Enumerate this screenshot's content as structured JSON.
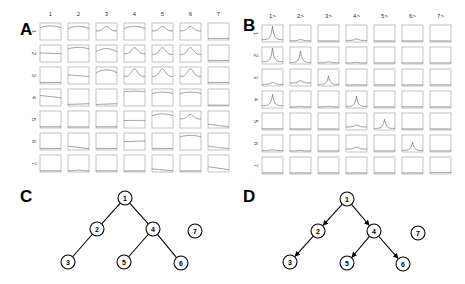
{
  "panels": {
    "A": {
      "letter": "A"
    },
    "B": {
      "letter": "B"
    },
    "C": {
      "letter": "C"
    },
    "D": {
      "letter": "D"
    }
  },
  "chart_data": [
    {
      "type": "line",
      "panel": "A",
      "title": "",
      "description": "7x7 grid of small line plots (row i vs column j)",
      "col_labels": [
        "1",
        "2",
        "3",
        "4",
        "5",
        "6",
        "7"
      ],
      "row_labels": [
        "1",
        "2",
        "3",
        "4",
        "5",
        "6",
        "7"
      ],
      "grid": [
        [
          {
            "shape": "arch",
            "level": 0.8,
            "amp": 0.12
          },
          {
            "shape": "arch",
            "level": 0.75,
            "amp": 0.15
          },
          {
            "shape": "peak",
            "level": 0.55,
            "amp": 0.3
          },
          {
            "shape": "arch",
            "level": 0.75,
            "amp": 0.15
          },
          {
            "shape": "peak",
            "level": 0.55,
            "amp": 0.3
          },
          {
            "shape": "peak",
            "level": 0.55,
            "amp": 0.3
          },
          {
            "shape": "flat",
            "level": 0.05
          }
        ],
        [
          {
            "shape": "slope",
            "level": 0.55,
            "end": 0.5
          },
          {
            "shape": "arch",
            "level": 0.85,
            "amp": 0.1
          },
          {
            "shape": "arch",
            "level": 0.7,
            "amp": 0.2
          },
          {
            "shape": "peak",
            "level": 0.5,
            "amp": 0.4
          },
          {
            "shape": "peak",
            "level": 0.45,
            "amp": 0.45
          },
          {
            "shape": "peak",
            "level": 0.45,
            "amp": 0.45
          },
          {
            "shape": "flat",
            "level": 0.05
          }
        ],
        [
          {
            "shape": "flat",
            "level": 0.05
          },
          {
            "shape": "slope",
            "level": 0.55,
            "end": 0.45
          },
          {
            "shape": "arch",
            "level": 0.75,
            "amp": 0.2
          },
          {
            "shape": "peak",
            "level": 0.45,
            "amp": 0.5
          },
          {
            "shape": "peak",
            "level": 0.45,
            "amp": 0.5
          },
          {
            "shape": "peak",
            "level": 0.45,
            "amp": 0.5
          },
          {
            "shape": "flat",
            "level": 0.05
          }
        ],
        [
          {
            "shape": "slope",
            "level": 0.65,
            "end": 0.5
          },
          {
            "shape": "slope",
            "level": 0.05,
            "end": 0.1
          },
          {
            "shape": "slope",
            "level": 0.05,
            "end": 0.1
          },
          {
            "shape": "arch",
            "level": 0.9,
            "amp": 0.05
          },
          {
            "shape": "arch",
            "level": 0.8,
            "amp": 0.1
          },
          {
            "shape": "arch",
            "level": 0.8,
            "amp": 0.1
          },
          {
            "shape": "flat",
            "level": 0.0
          }
        ],
        [
          {
            "shape": "flat",
            "level": 0.03
          },
          {
            "shape": "flat",
            "level": 0.02
          },
          {
            "shape": "flat",
            "level": 0.03
          },
          {
            "shape": "slope",
            "level": 0.45,
            "end": 0.45
          },
          {
            "shape": "arch",
            "level": 0.8,
            "amp": 0.12
          },
          {
            "shape": "peak",
            "level": 0.55,
            "amp": 0.3
          },
          {
            "shape": "slope",
            "level": 0.2,
            "end": 0.03
          }
        ],
        [
          {
            "shape": "flat",
            "level": 0.05
          },
          {
            "shape": "slope",
            "level": 0.2,
            "end": 0.03
          },
          {
            "shape": "flat",
            "level": 0.05
          },
          {
            "shape": "slope",
            "level": 0.5,
            "end": 0.55
          },
          {
            "shape": "flat",
            "level": 0.05
          },
          {
            "shape": "arch",
            "level": 0.85,
            "amp": 0.1
          },
          {
            "shape": "slope",
            "level": 0.2,
            "end": 0.03
          }
        ],
        [
          {
            "shape": "flat",
            "level": 0.03
          },
          {
            "shape": "bump",
            "level": 0.03,
            "amp": 0.05
          },
          {
            "shape": "flat",
            "level": 0.03
          },
          {
            "shape": "flat",
            "level": 0.02
          },
          {
            "shape": "slope",
            "level": 0.15,
            "end": 0.02
          },
          {
            "shape": "flat",
            "level": 0.02
          },
          {
            "shape": "slope",
            "level": 0.3,
            "end": 0.1
          }
        ]
      ]
    },
    {
      "type": "line",
      "panel": "B",
      "title": "",
      "description": "7x7 grid of small line plots; sharp peaks mostly on diagonal",
      "col_labels": [
        "1>",
        "2>",
        "3>",
        "4>",
        "5>",
        "6>",
        "7>"
      ],
      "row_labels": [
        "1",
        "2",
        "3",
        "4",
        "5",
        "6",
        "7"
      ],
      "grid": [
        [
          {
            "shape": "spike",
            "level": 0.1,
            "amp": 0.9
          },
          {
            "shape": "bump",
            "level": 0.03,
            "amp": 0.08
          },
          {
            "shape": "flat",
            "level": 0.02
          },
          {
            "shape": "bump",
            "level": 0.05,
            "amp": 0.1
          },
          {
            "shape": "flat",
            "level": 0.02
          },
          {
            "shape": "flat",
            "level": 0.02
          },
          {
            "shape": "flat",
            "level": 0.02
          }
        ],
        [
          {
            "shape": "spike",
            "level": 0.1,
            "amp": 0.9
          },
          {
            "shape": "spike",
            "level": 0.05,
            "amp": 0.75
          },
          {
            "shape": "bump",
            "level": 0.03,
            "amp": 0.06
          },
          {
            "shape": "bump",
            "level": 0.02,
            "amp": 0.04
          },
          {
            "shape": "flat",
            "level": 0.02
          },
          {
            "shape": "flat",
            "level": 0.02
          },
          {
            "shape": "flat",
            "level": 0.02
          }
        ],
        [
          {
            "shape": "bump",
            "level": 0.05,
            "amp": 0.12
          },
          {
            "shape": "bump",
            "level": 0.15,
            "amp": 0.15
          },
          {
            "shape": "spike",
            "level": 0.05,
            "amp": 0.55
          },
          {
            "shape": "flat",
            "level": 0.02
          },
          {
            "shape": "flat",
            "level": 0.02
          },
          {
            "shape": "flat",
            "level": 0.02
          },
          {
            "shape": "flat",
            "level": 0.02
          }
        ],
        [
          {
            "shape": "spike",
            "level": 0.1,
            "amp": 0.75
          },
          {
            "shape": "bump",
            "level": 0.02,
            "amp": 0.04
          },
          {
            "shape": "bump",
            "level": 0.02,
            "amp": 0.04
          },
          {
            "shape": "spike",
            "level": 0.05,
            "amp": 0.7
          },
          {
            "shape": "flat",
            "level": 0.02
          },
          {
            "shape": "flat",
            "level": 0.03
          },
          {
            "shape": "flat",
            "level": 0.02
          }
        ],
        [
          {
            "shape": "flat",
            "level": 0.03
          },
          {
            "shape": "flat",
            "level": 0.02
          },
          {
            "shape": "flat",
            "level": 0.02
          },
          {
            "shape": "bump",
            "level": 0.15,
            "amp": 0.12
          },
          {
            "shape": "spike",
            "level": 0.05,
            "amp": 0.6
          },
          {
            "shape": "flat",
            "level": 0.02
          },
          {
            "shape": "flat",
            "level": 0.02
          }
        ],
        [
          {
            "shape": "bump",
            "level": 0.04,
            "amp": 0.05
          },
          {
            "shape": "bump",
            "level": 0.02,
            "amp": 0.03
          },
          {
            "shape": "flat",
            "level": 0.02
          },
          {
            "shape": "bump",
            "level": 0.15,
            "amp": 0.12
          },
          {
            "shape": "flat",
            "level": 0.02
          },
          {
            "shape": "spike",
            "level": 0.05,
            "amp": 0.55
          },
          {
            "shape": "flat",
            "level": 0.02
          }
        ],
        [
          {
            "shape": "flat",
            "level": 0.02
          },
          {
            "shape": "flat",
            "level": 0.02
          },
          {
            "shape": "flat",
            "level": 0.02
          },
          {
            "shape": "flat",
            "level": 0.02
          },
          {
            "shape": "flat",
            "level": 0.02
          },
          {
            "shape": "flat",
            "level": 0.02
          },
          {
            "shape": "flat",
            "level": 0.05
          }
        ]
      ]
    }
  ],
  "graphs": {
    "C": {
      "directed": false,
      "nodes": [
        {
          "id": "1",
          "x": 125,
          "y": 198
        },
        {
          "id": "2",
          "x": 97,
          "y": 229
        },
        {
          "id": "4",
          "x": 153,
          "y": 229
        },
        {
          "id": "7",
          "x": 195,
          "y": 231
        },
        {
          "id": "3",
          "x": 68,
          "y": 262
        },
        {
          "id": "5",
          "x": 124,
          "y": 262
        },
        {
          "id": "6",
          "x": 181,
          "y": 263
        }
      ],
      "edges": [
        [
          "1",
          "2"
        ],
        [
          "1",
          "4"
        ],
        [
          "2",
          "3"
        ],
        [
          "4",
          "5"
        ],
        [
          "4",
          "6"
        ]
      ]
    },
    "D": {
      "directed": true,
      "nodes": [
        {
          "id": "1",
          "x": 347,
          "y": 199
        },
        {
          "id": "2",
          "x": 318,
          "y": 231
        },
        {
          "id": "4",
          "x": 374,
          "y": 231
        },
        {
          "id": "7",
          "x": 418,
          "y": 233
        },
        {
          "id": "3",
          "x": 290,
          "y": 262
        },
        {
          "id": "5",
          "x": 347,
          "y": 263
        },
        {
          "id": "6",
          "x": 403,
          "y": 264
        }
      ],
      "edges": [
        [
          "1",
          "2"
        ],
        [
          "1",
          "4"
        ],
        [
          "2",
          "3"
        ],
        [
          "4",
          "5"
        ],
        [
          "4",
          "6"
        ]
      ]
    }
  }
}
